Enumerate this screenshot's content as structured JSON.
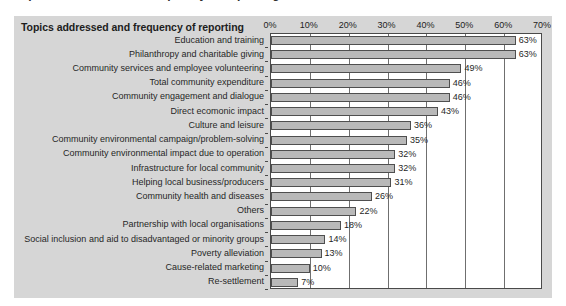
{
  "figure": {
    "clipped_caption_above": "Topics addressed and frequency of reporting",
    "header": "Topics addressed and frequency of reporting"
  },
  "chart_data": {
    "type": "bar",
    "orientation": "horizontal",
    "title": "Topics addressed and frequency of reporting",
    "xlabel": "",
    "ylabel": "",
    "xlim": [
      0,
      70
    ],
    "xtick_labels": [
      "0%",
      "10%",
      "20%",
      "30%",
      "40%",
      "50%",
      "60%",
      "70%"
    ],
    "xticks": [
      0,
      10,
      20,
      30,
      40,
      50,
      60,
      70
    ],
    "grid": true,
    "legend": null,
    "value_suffix": "%",
    "bar_color": "#b9b9b9",
    "bar_edge_color": "#4f4f4f",
    "panel_color": "#d6d6d6",
    "plot_background": "#ffffff",
    "categories": [
      "Education and training",
      "Philanthropy and charitable giving",
      "Community services and employee volunteering",
      "Total community expenditure",
      "Community engagement and dialogue",
      "Direct ecomonic impact",
      "Culture and leisure",
      "Community environmental campaign/problem-solving",
      "Community environmental impact due to operation",
      "Infrastructure for local community",
      "Helping local business/producers",
      "Community health and diseases",
      "Others",
      "Partnership with local organisations",
      "Social inclusion and aid to disadvantaged or minority groups",
      "Poverty alleviation",
      "Cause-related marketing",
      "Re-settlement"
    ],
    "values": [
      63,
      63,
      49,
      46,
      46,
      43,
      36,
      35,
      32,
      32,
      31,
      26,
      22,
      18,
      14,
      13,
      10,
      7
    ],
    "value_labels": [
      "63%",
      "63%",
      "49%",
      "46%",
      "46%",
      "43%",
      "36%",
      "35%",
      "32%",
      "32%",
      "31%",
      "26%",
      "22%",
      "18%",
      "14%",
      "13%",
      "10%",
      "7%"
    ]
  }
}
